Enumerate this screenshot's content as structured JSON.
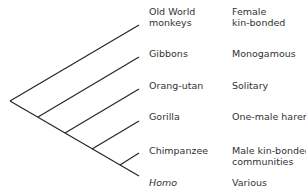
{
  "diagram": {
    "type": "cladogram",
    "line_color": "#222222",
    "text_color": "#333333",
    "taxa": [
      {
        "name_lines": [
          "Old World",
          "monkeys"
        ],
        "social": [
          "Female",
          "kin-bonded"
        ],
        "italic": false
      },
      {
        "name_lines": [
          "Gibbons"
        ],
        "social": [
          "Monogamous"
        ],
        "italic": false
      },
      {
        "name_lines": [
          "Orang-utan"
        ],
        "social": [
          "Solitary"
        ],
        "italic": false
      },
      {
        "name_lines": [
          "Gorilla"
        ],
        "social": [
          "One-male harem"
        ],
        "italic": false
      },
      {
        "name_lines": [
          "Chimpanzee"
        ],
        "social": [
          "Male kin-bonded",
          "communities"
        ],
        "italic": false
      },
      {
        "name_lines": [
          "Homo"
        ],
        "social": [
          "Various"
        ],
        "italic": true
      }
    ]
  }
}
